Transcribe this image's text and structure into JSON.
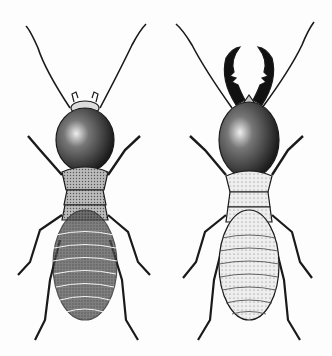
{
  "illustration": {
    "subject": "two termites, dorsal view, engraving",
    "background": "#fdfdfd",
    "ink": "#1a1a1a",
    "figures": [
      {
        "label": "termite-worker-left",
        "head_style": "small mandibles, dark rounded head",
        "abdomen_shade": "dark"
      },
      {
        "label": "termite-soldier-right",
        "head_style": "large toothed mandibles, dark oval head",
        "abdomen_shade": "light"
      }
    ]
  }
}
